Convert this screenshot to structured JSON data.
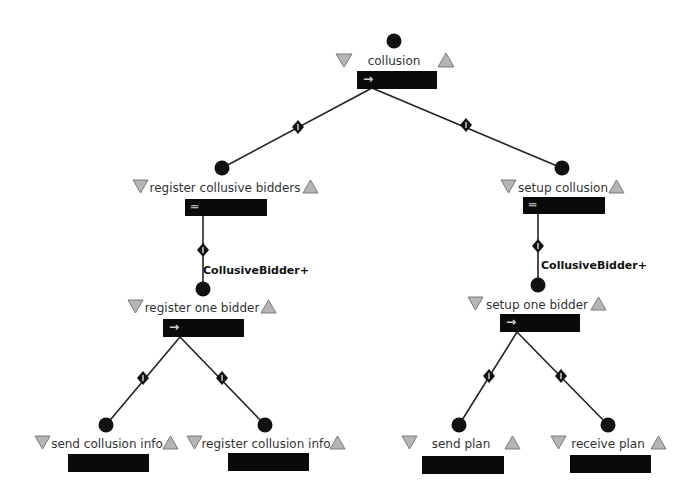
{
  "diagram": {
    "type": "goal-tree",
    "nodes": [
      {
        "id": "collusion",
        "label": "collusion",
        "operator": "→",
        "operator_name": "sequence"
      },
      {
        "id": "register_collusive_bidders",
        "label": "register collusive bidders",
        "operator": "═",
        "operator_name": "parallel"
      },
      {
        "id": "setup_collusion",
        "label": "setup collusion",
        "operator": "═",
        "operator_name": "parallel"
      },
      {
        "id": "register_one_bidder",
        "label": "register one bidder",
        "operator": "→",
        "operator_name": "sequence"
      },
      {
        "id": "setup_one_bidder",
        "label": "setup one bidder",
        "operator": "→",
        "operator_name": "sequence"
      },
      {
        "id": "send_collusion_info",
        "label": "send collusion info",
        "operator": ""
      },
      {
        "id": "register_collusion_info",
        "label": "register collusion info",
        "operator": ""
      },
      {
        "id": "send_plan",
        "label": "send plan",
        "operator": ""
      },
      {
        "id": "receive_plan",
        "label": "receive plan",
        "operator": ""
      }
    ],
    "edges": [
      {
        "from": "collusion",
        "to": "register_collusive_bidders",
        "marker": "1"
      },
      {
        "from": "collusion",
        "to": "setup_collusion",
        "marker": "1"
      },
      {
        "from": "register_collusive_bidders",
        "to": "register_one_bidder",
        "marker": "1",
        "multiplicity": "CollusiveBidder+"
      },
      {
        "from": "setup_collusion",
        "to": "setup_one_bidder",
        "marker": "1",
        "multiplicity": "CollusiveBidder+"
      },
      {
        "from": "register_one_bidder",
        "to": "send_collusion_info",
        "marker": "1"
      },
      {
        "from": "register_one_bidder",
        "to": "register_collusion_info",
        "marker": "1"
      },
      {
        "from": "setup_one_bidder",
        "to": "send_plan",
        "marker": "1"
      },
      {
        "from": "setup_one_bidder",
        "to": "receive_plan",
        "marker": "1"
      }
    ],
    "multiplicity_labels": {
      "left": "CollusiveBidder+",
      "right": "CollusiveBidder+"
    },
    "icons": {
      "collapse": "▽",
      "expand": "△",
      "sequence": "→",
      "parallel": "═"
    },
    "colors": {
      "bar": "#0a0a0a",
      "dot": "#111111",
      "triangle_fill": "#b5b5b5",
      "triangle_stroke": "#7a7a7a",
      "edge": "#222222"
    }
  }
}
